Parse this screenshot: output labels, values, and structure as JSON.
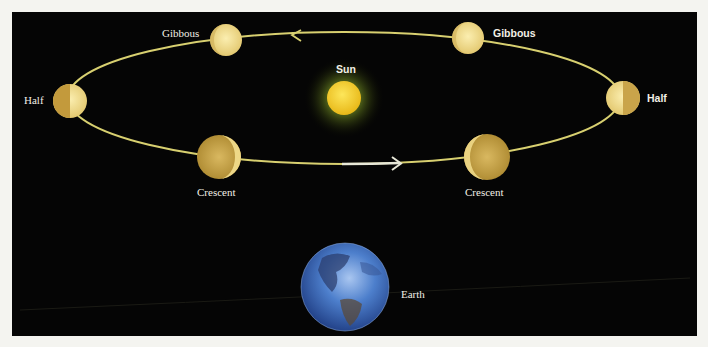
{
  "diagram": {
    "colors": {
      "background": "#050505",
      "page": "#f4f4f0",
      "orbit": "#d8d070",
      "orbit_arrow_segment": "#e8e8d8",
      "planet_light": "#f3e19a",
      "planet_shadow": "#b8963a",
      "sun_core": "#f7d22a",
      "sun_glow": "#6f8a22",
      "earth": "#3f6fc0",
      "label": "#f2f0e6"
    },
    "sun": {
      "label": "Sun"
    },
    "earth": {
      "label": "Earth"
    },
    "phases": [
      {
        "id": "gibbous-left",
        "label": "Gibbous"
      },
      {
        "id": "gibbous-right",
        "label": "Gibbous"
      },
      {
        "id": "half-left",
        "label": "Half"
      },
      {
        "id": "half-right",
        "label": "Half"
      },
      {
        "id": "crescent-left",
        "label": "Crescent"
      },
      {
        "id": "crescent-right",
        "label": "Crescent"
      }
    ]
  }
}
